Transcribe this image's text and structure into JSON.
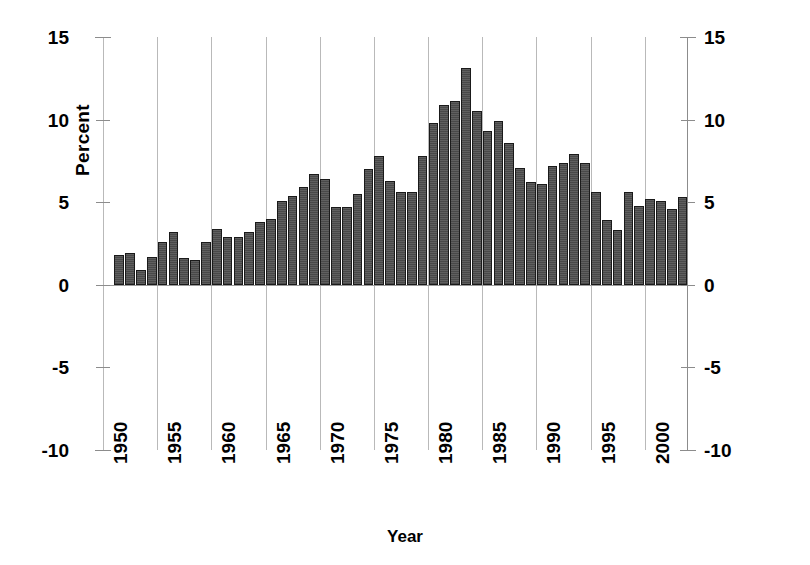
{
  "chart_data": {
    "type": "bar",
    "title": "",
    "xlabel": "Year",
    "ylabel": "Percent",
    "ylim": [
      -10,
      15
    ],
    "yticks": [
      15,
      10,
      5,
      0,
      -5,
      -10
    ],
    "ytick_labels": [
      "15",
      "10",
      "5",
      "0",
      "-5",
      "-10"
    ],
    "xlim": [
      1950,
      2004
    ],
    "xticks": [
      1950,
      1955,
      1960,
      1965,
      1970,
      1975,
      1980,
      1985,
      1990,
      1995,
      2000
    ],
    "xtick_labels": [
      "1950",
      "1955",
      "1960",
      "1965",
      "1970",
      "1975",
      "1980",
      "1985",
      "1990",
      "1995",
      "2000"
    ],
    "grid": "vertical",
    "legend": "none",
    "bar_color": "#4d4d4d",
    "bar_edge_color": "#1a1a1a",
    "categories": [
      1951,
      1952,
      1953,
      1954,
      1955,
      1956,
      1957,
      1958,
      1959,
      1960,
      1961,
      1962,
      1963,
      1964,
      1965,
      1966,
      1967,
      1968,
      1969,
      1970,
      1971,
      1972,
      1973,
      1974,
      1975,
      1976,
      1977,
      1978,
      1979,
      1980,
      1981,
      1982,
      1983,
      1984,
      1985,
      1986,
      1987,
      1988,
      1989,
      1990,
      1991,
      1992,
      1993,
      1994,
      1995,
      1996,
      1997,
      1998,
      1999,
      2000,
      2001,
      2002,
      2003
    ],
    "values": [
      1.8,
      1.9,
      0.9,
      1.7,
      2.6,
      3.2,
      1.6,
      1.5,
      2.6,
      3.4,
      2.9,
      2.9,
      3.2,
      3.8,
      4.0,
      5.1,
      5.4,
      5.9,
      6.7,
      6.4,
      4.7,
      4.7,
      5.5,
      7.0,
      7.8,
      6.3,
      5.6,
      5.6,
      7.8,
      9.8,
      10.9,
      11.1,
      13.1,
      10.5,
      9.3,
      9.9,
      8.6,
      7.1,
      6.2,
      6.1,
      7.2,
      7.4,
      7.9,
      7.4,
      5.6,
      3.9,
      3.3,
      5.6,
      4.8,
      5.2,
      5.1,
      4.6,
      5.3
    ]
  },
  "axis": {
    "ylabel_text": "Percent",
    "xlabel_text": "Year"
  }
}
